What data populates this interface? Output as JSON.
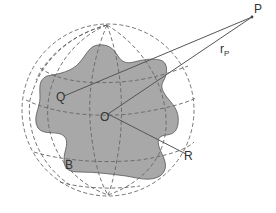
{
  "diagram": {
    "title": "",
    "colors": {
      "body_fill": "#a8a8a8",
      "body_stroke": "#555555",
      "sphere_grid": "#666666",
      "lines": "#555555",
      "text": "#333333"
    },
    "labels": {
      "P": "P",
      "r_main": "r",
      "r_sub": "P",
      "Q": "Q",
      "O": "O",
      "R": "R",
      "B": "B"
    },
    "points": [
      {
        "id": "P",
        "x": 252,
        "y": 17,
        "description": "external field point"
      },
      {
        "id": "O",
        "x": 108,
        "y": 114,
        "description": "origin / center"
      },
      {
        "id": "Q",
        "x": 64,
        "y": 96,
        "description": "point inside body"
      },
      {
        "id": "R",
        "x": 186,
        "y": 154,
        "description": "point on bounding sphere"
      }
    ],
    "segments": [
      {
        "from": "P",
        "to": "Q"
      },
      {
        "from": "P",
        "to": "O",
        "label": "r_P"
      },
      {
        "from": "O",
        "to": "R"
      }
    ],
    "sphere": {
      "cx": 108,
      "cy": 110,
      "r": 86,
      "style": "dashed wireframe (meridians and parallels)"
    },
    "body": {
      "label": "B",
      "style": "irregular shaded blob"
    }
  }
}
